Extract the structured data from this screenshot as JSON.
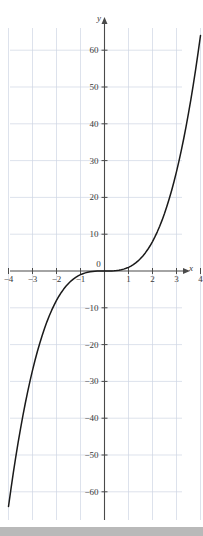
{
  "figure": {
    "background_color": "#ffffff",
    "grid_color": "#cfd6e4",
    "axis_color": "#4a4a4a",
    "curve_color": "#1a1a1a",
    "label_color": "#3a3a3a",
    "bottom_band_color": "#b9b9b9"
  },
  "axis_names": {
    "x": "x",
    "y": "y"
  },
  "chart_data": {
    "type": "line",
    "title": "",
    "xlabel": "x",
    "ylabel": "y",
    "grid": true,
    "legend": "none",
    "xlim": [
      -4.6,
      4.6
    ],
    "ylim": [
      -66,
      66
    ],
    "x_ticks": [
      -4,
      -3,
      -2,
      -1,
      0,
      1,
      2,
      3,
      4
    ],
    "x_tick_labels": [
      "−4",
      "−3",
      "−2",
      "−1",
      "0",
      "1",
      "2",
      "3",
      "4"
    ],
    "y_ticks": [
      -60,
      -50,
      -40,
      -30,
      -20,
      -10,
      10,
      20,
      30,
      40,
      50,
      60
    ],
    "y_tick_labels": [
      "−60",
      "−50",
      "−40",
      "−30",
      "−20",
      "−10",
      "10",
      "20",
      "30",
      "40",
      "50",
      "60"
    ],
    "series": [
      {
        "name": "y = x³",
        "equation": "y = x^3",
        "x": [
          -4.0,
          -3.9,
          -3.8,
          -3.7,
          -3.6,
          -3.5,
          -3.4,
          -3.3,
          -3.2,
          -3.1,
          -3.0,
          -2.9,
          -2.8,
          -2.7,
          -2.6,
          -2.5,
          -2.4,
          -2.3,
          -2.2,
          -2.1,
          -2.0,
          -1.9,
          -1.8,
          -1.7,
          -1.6,
          -1.5,
          -1.4,
          -1.3,
          -1.2,
          -1.1,
          -1.0,
          -0.9,
          -0.8,
          -0.7,
          -0.6,
          -0.5,
          -0.4,
          -0.3,
          -0.2,
          -0.1,
          0.0,
          0.1,
          0.2,
          0.3,
          0.4,
          0.5,
          0.6,
          0.7,
          0.8,
          0.9,
          1.0,
          1.1,
          1.2,
          1.3,
          1.4,
          1.5,
          1.6,
          1.7,
          1.8,
          1.9,
          2.0,
          2.1,
          2.2,
          2.3,
          2.4,
          2.5,
          2.6,
          2.7,
          2.8,
          2.9,
          3.0,
          3.1,
          3.2,
          3.3,
          3.4,
          3.5,
          3.6,
          3.7,
          3.8,
          3.9,
          4.0
        ],
        "y": [
          -64.0,
          -59.32,
          -54.87,
          -50.65,
          -46.66,
          -42.88,
          -39.3,
          -35.94,
          -32.77,
          -29.79,
          -27.0,
          -24.39,
          -21.95,
          -19.68,
          -17.58,
          -15.63,
          -13.82,
          -12.17,
          -10.65,
          -9.26,
          -8.0,
          -6.86,
          -5.83,
          -4.91,
          -4.1,
          -3.38,
          -2.74,
          -2.2,
          -1.73,
          -1.33,
          -1.0,
          -0.73,
          -0.51,
          -0.34,
          -0.22,
          -0.13,
          -0.06,
          -0.03,
          -0.01,
          0.0,
          0.0,
          0.0,
          0.01,
          0.03,
          0.06,
          0.13,
          0.22,
          0.34,
          0.51,
          0.73,
          1.0,
          1.33,
          1.73,
          2.2,
          2.74,
          3.38,
          4.1,
          4.91,
          5.83,
          6.86,
          8.0,
          9.26,
          10.65,
          12.17,
          13.82,
          15.63,
          17.58,
          19.68,
          21.95,
          24.39,
          27.0,
          29.79,
          32.77,
          35.94,
          39.3,
          42.88,
          46.66,
          50.65,
          54.87,
          59.32,
          64.0
        ]
      }
    ]
  }
}
